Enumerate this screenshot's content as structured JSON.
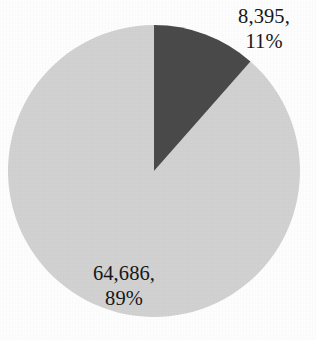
{
  "chart_data": {
    "type": "pie",
    "title": "",
    "subtitle": "",
    "xlabel": "",
    "ylabel": "",
    "legend": "none",
    "grid": false,
    "slices": [
      {
        "name": "dark-slice",
        "value": 8395,
        "value_label": "8,395,",
        "percent": 11,
        "percent_label": "11%",
        "color": "#4a4a4a",
        "start_angle_deg": 0,
        "end_angle_deg": 39.6,
        "label_position": "outside-top-right"
      },
      {
        "name": "light-slice",
        "value": 64686,
        "value_label": "64,686,",
        "percent": 89,
        "percent_label": "89%",
        "color": "#d2d2d2",
        "start_angle_deg": 39.6,
        "end_angle_deg": 360,
        "label_position": "inside-bottom-left"
      }
    ],
    "total": 73081,
    "annotations": [
      {
        "text": "8,395,",
        "x": 264,
        "y": 18
      },
      {
        "text": "11%",
        "x": 276,
        "y": 43
      },
      {
        "text": "64,686,",
        "x": 124,
        "y": 275
      },
      {
        "text": "89%",
        "x": 124,
        "y": 300
      }
    ]
  },
  "geometry": {
    "center_x": 154,
    "center_y": 171,
    "radius": 146,
    "rotation_deg": 0
  },
  "colors": {
    "background": "#fefefe",
    "dark_slice": "#4a4a4a",
    "light_slice": "#d2d2d2",
    "text": "#171717"
  }
}
